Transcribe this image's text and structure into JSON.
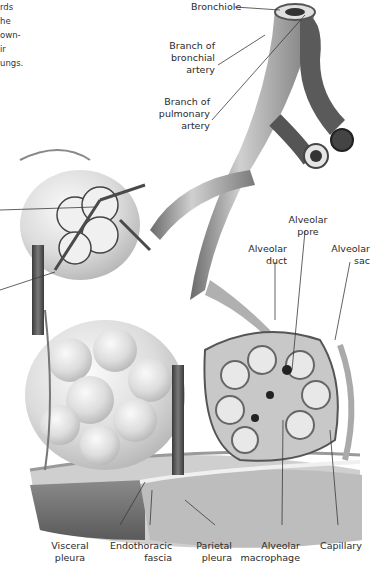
{
  "intro_text_fragments": [
    "rds",
    "he",
    "own-",
    "ir",
    "ungs."
  ],
  "colors": {
    "background": "#ffffff",
    "label_text": "#2a2a2a",
    "leader_line": "#3a3a3a",
    "vessel_dark": "#4a4a4a",
    "tissue_light": "#d9d9d9"
  },
  "labels": {
    "bronchiole": "Bronchiole",
    "bronchial_artery": [
      "Branch of",
      "bronchial",
      "artery"
    ],
    "pulmonary_artery": [
      "Branch of",
      "pulmonary",
      "artery"
    ],
    "alveolar_pore": [
      "Alveolar",
      "pore"
    ],
    "alveolar_duct": [
      "Alveolar",
      "duct"
    ],
    "alveolar_sac": [
      "Alveolar",
      "sac"
    ],
    "visceral_pleura": [
      "Visceral",
      "pleura"
    ],
    "endothoracic_fascia": [
      "Endothoracic",
      "fascia"
    ],
    "parietal_pleura": [
      "Parietal",
      "pleura"
    ],
    "alveolar_macrophage": [
      "Alveolar",
      "macrophage"
    ],
    "capillary": "Capillary"
  }
}
